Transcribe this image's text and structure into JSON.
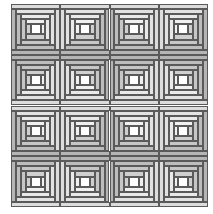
{
  "quilt": {
    "pattern": "log cabin",
    "rows": 4,
    "cols": 4,
    "block_width": 49.25,
    "block_height": 50.75,
    "rounds": 4,
    "center_fraction": 0.2,
    "colors": {
      "center": "#ffffff",
      "light": [
        "#f0f0f0",
        "#e9e9e9",
        "#e2e2e2",
        "#dcdcdc"
      ],
      "dark": [
        "#cfcfcf",
        "#c6c6c6",
        "#bdbdbd",
        "#b5b5b5"
      ],
      "line": "#5a5a5a"
    },
    "blocks": [
      {
        "dark_sides": [
          "left",
          "bottom"
        ]
      },
      {
        "dark_sides": [
          "right",
          "bottom"
        ]
      },
      {
        "dark_sides": [
          "left",
          "bottom"
        ]
      },
      {
        "dark_sides": [
          "right",
          "bottom"
        ]
      },
      {
        "dark_sides": [
          "left",
          "top"
        ]
      },
      {
        "dark_sides": [
          "right",
          "top"
        ]
      },
      {
        "dark_sides": [
          "left",
          "top"
        ]
      },
      {
        "dark_sides": [
          "right",
          "top"
        ]
      },
      {
        "dark_sides": [
          "left",
          "bottom"
        ]
      },
      {
        "dark_sides": [
          "right",
          "bottom"
        ]
      },
      {
        "dark_sides": [
          "left",
          "bottom"
        ]
      },
      {
        "dark_sides": [
          "right",
          "bottom"
        ]
      },
      {
        "dark_sides": [
          "left",
          "top"
        ]
      },
      {
        "dark_sides": [
          "right",
          "top"
        ]
      },
      {
        "dark_sides": [
          "left",
          "top"
        ]
      },
      {
        "dark_sides": [
          "right",
          "top"
        ]
      }
    ]
  }
}
